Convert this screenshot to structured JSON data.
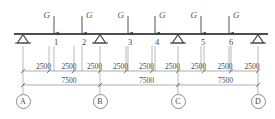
{
  "diagram": {
    "beam": {
      "y": 34,
      "x_start": 14,
      "x_end": 268,
      "color": "#4f4f4f"
    },
    "units_note": "",
    "loads": [
      {
        "id": "load-1",
        "label": "G",
        "x": 54,
        "label_side": "left"
      },
      {
        "id": "load-2",
        "label": "G",
        "x": 82,
        "label_side": "right"
      },
      {
        "id": "load-3",
        "label": "G",
        "x": 128,
        "label_side": "left"
      },
      {
        "id": "load-4",
        "label": "G",
        "x": 155,
        "label_side": "right"
      },
      {
        "id": "load-5",
        "label": "G",
        "x": 201,
        "label_side": "left"
      },
      {
        "id": "load-6",
        "label": "G",
        "x": 229,
        "label_side": "right"
      }
    ],
    "nodes": [
      {
        "id": "node-1",
        "label": "1",
        "x": 54
      },
      {
        "id": "node-2",
        "label": "2",
        "x": 82
      },
      {
        "id": "node-3",
        "label": "3",
        "x": 128
      },
      {
        "id": "node-4",
        "label": "4",
        "x": 155
      },
      {
        "id": "node-5",
        "label": "5",
        "x": 201
      },
      {
        "id": "node-6",
        "label": "6",
        "x": 229
      }
    ],
    "supports": [
      {
        "id": "support-a",
        "x": 23,
        "type": "hinge"
      },
      {
        "id": "support-b",
        "x": 100,
        "type": "hinge"
      },
      {
        "id": "support-c",
        "x": 178,
        "type": "hinge"
      },
      {
        "id": "support-d",
        "x": 258,
        "type": "hinge"
      }
    ],
    "dimension_chain": {
      "y": 71,
      "label_count": 9,
      "values": [
        "2500",
        "2500",
        "2500",
        "2500",
        "2500",
        "2500",
        "2500",
        "2500",
        "2500"
      ],
      "ticks_x": [
        23,
        49,
        74,
        100,
        126,
        152,
        178,
        204,
        231,
        258
      ]
    },
    "span_chain": {
      "y": 85,
      "values": [
        "7500",
        "7500",
        "7500"
      ],
      "ticks_x": [
        23,
        100,
        178,
        258
      ]
    },
    "grid_labels": [
      {
        "id": "grid-a",
        "label": "A",
        "x": 23
      },
      {
        "id": "grid-b",
        "label": "B",
        "x": 100
      },
      {
        "id": "grid-c",
        "label": "C",
        "x": 178
      },
      {
        "id": "grid-d",
        "label": "D",
        "x": 258
      }
    ],
    "colors": {
      "line": "#4f4f4f",
      "thin_line": "#8a8a8a",
      "text": "#4a4a4a"
    }
  }
}
